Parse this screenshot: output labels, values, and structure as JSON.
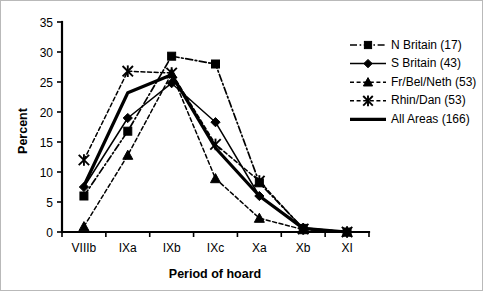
{
  "chart_data": {
    "type": "line",
    "title": "",
    "xlabel": "Period of hoard",
    "ylabel": "Percent",
    "categories": [
      "VIIIb",
      "IXa",
      "IXb",
      "IXc",
      "Xa",
      "Xb",
      "XI"
    ],
    "ylim": [
      0,
      35
    ],
    "yticks": [
      0,
      5,
      10,
      15,
      20,
      25,
      30,
      35
    ],
    "grid": false,
    "legend_position": "right",
    "series": [
      {
        "name": "N Britain (17)",
        "count": 17,
        "marker": "square",
        "linestyle": "dash-dot",
        "color": "#000000",
        "values": [
          6.0,
          16.8,
          29.3,
          28.0,
          8.2,
          0.6,
          0.0
        ]
      },
      {
        "name": "S Britain (43)",
        "count": 43,
        "marker": "diamond",
        "linestyle": "solid",
        "color": "#000000",
        "values": [
          7.5,
          19.0,
          24.8,
          18.3,
          6.0,
          0.7,
          0.0
        ]
      },
      {
        "name": "Fr/Bel/Neth (53)",
        "count": 53,
        "marker": "triangle",
        "linestyle": "dashed",
        "color": "#000000",
        "values": [
          0.9,
          12.8,
          26.4,
          8.9,
          2.3,
          0.4,
          0.0
        ]
      },
      {
        "name": "Rhin/Dan (53)",
        "count": 53,
        "marker": "x-star",
        "linestyle": "dashed",
        "color": "#000000",
        "values": [
          12.0,
          26.8,
          26.5,
          14.6,
          8.5,
          0.5,
          0.0
        ]
      },
      {
        "name": "All Areas (166)",
        "count": 166,
        "marker": "none",
        "linestyle": "thick-solid",
        "color": "#000000",
        "values": [
          7.7,
          23.2,
          26.2,
          14.0,
          6.0,
          0.6,
          0.0
        ]
      }
    ]
  },
  "legend": {
    "items": [
      {
        "label": "N Britain (17)"
      },
      {
        "label": "S Britain (43)"
      },
      {
        "label": "Fr/Bel/Neth (53)"
      },
      {
        "label": "Rhin/Dan (53)"
      },
      {
        "label": "All Areas (166)"
      }
    ]
  },
  "axes": {
    "y_title": "Percent",
    "x_title": "Period of hoard",
    "y_ticks": [
      "0",
      "5",
      "10",
      "15",
      "20",
      "25",
      "30",
      "35"
    ],
    "x_ticks": [
      "VIIIb",
      "IXa",
      "IXb",
      "IXc",
      "Xa",
      "Xb",
      "XI"
    ]
  }
}
